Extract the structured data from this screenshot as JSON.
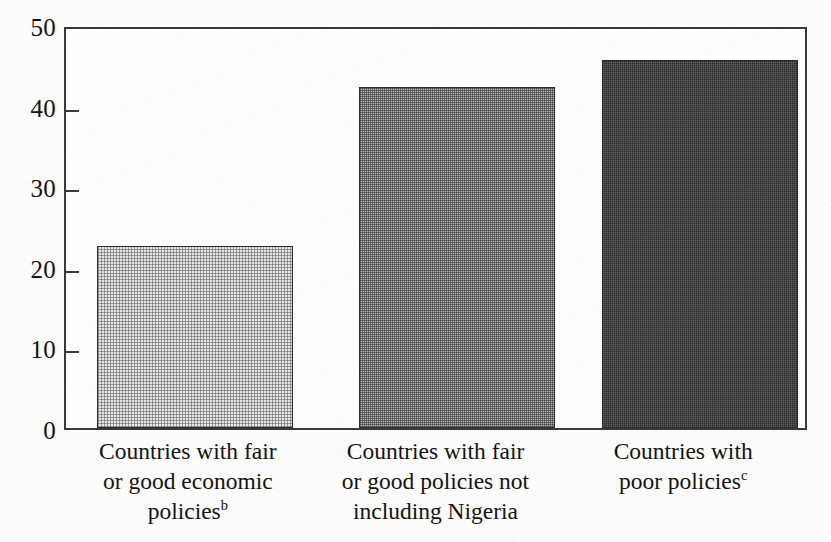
{
  "chart_data": {
    "type": "bar",
    "title": "",
    "xlabel": "",
    "ylabel": "",
    "ylim": [
      0,
      50
    ],
    "ytick_values": [
      0,
      10,
      20,
      30,
      40,
      50
    ],
    "ytick_labels": [
      "0",
      "10",
      "20",
      "30",
      "40",
      "50"
    ],
    "grid": false,
    "legend": "none",
    "categories": [
      "Countries with fair or good economic policiesᵇ",
      "Countries with fair or good policies not including Nigeria",
      "Countries with poor policiesᶜ"
    ],
    "category_lines": [
      [
        "Countries with fair",
        "or good economic",
        "policies"
      ],
      [
        "Countries with fair",
        "or good policies not",
        "including Nigeria"
      ],
      [
        "Countries with",
        "poor policies"
      ]
    ],
    "category_footnotes": [
      "b",
      "",
      "c"
    ],
    "values": [
      22.6,
      42.3,
      45.6
    ],
    "bar_fills": [
      "light-halftone",
      "medium-checker",
      "dark-solid"
    ],
    "colors": {
      "bar_light": "#e6e6e6",
      "bar_medium": "#b9b9b9",
      "bar_dark": "#2a2a2a",
      "axis": "#3a3a3a",
      "text": "#131313",
      "background": "#fcfcfa"
    }
  }
}
